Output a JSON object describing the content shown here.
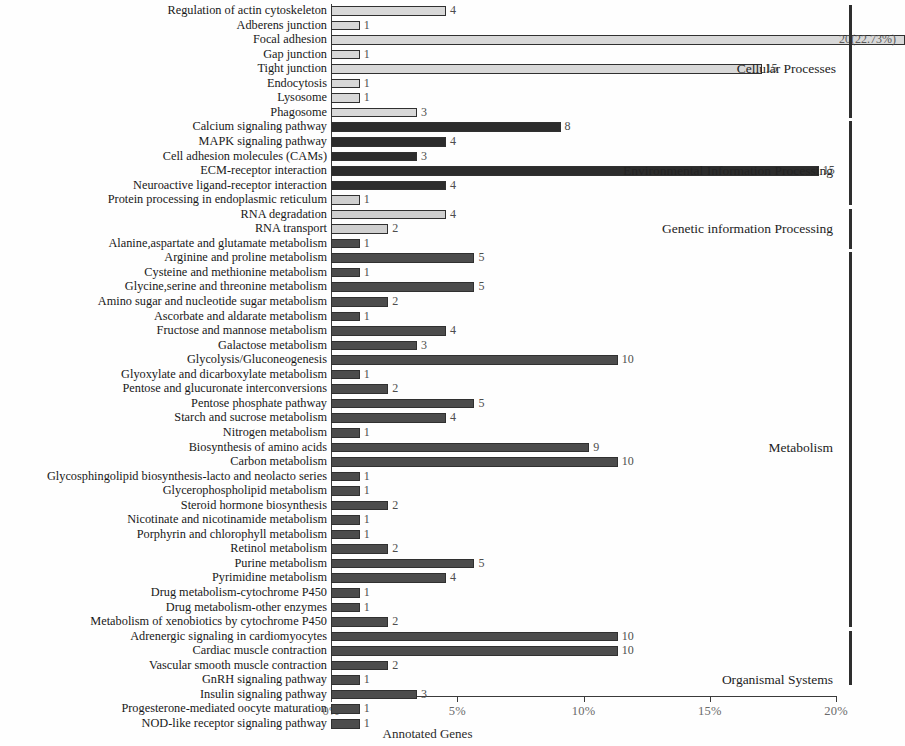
{
  "chart_data": {
    "type": "bar",
    "orientation": "horizontal",
    "title": "",
    "xlabel": "Annotated Genes",
    "ylabel": "",
    "xlim": [
      0,
      20
    ],
    "xunit": "%",
    "grid": false,
    "total_genes": 88,
    "tick_labels": [
      "0%",
      "5%",
      "10%",
      "15%",
      "20%"
    ],
    "tick_values": [
      0,
      5,
      10,
      15,
      20
    ],
    "legend_position": "right-inline-group-labels",
    "groups": [
      {
        "name": "Cellular Processes",
        "color": "#d8d8d8",
        "start_index": 0,
        "end_index": 7
      },
      {
        "name": "Environmental Information Processing",
        "color": "#2c2c2c",
        "start_index": 8,
        "end_index": 13
      },
      {
        "name": "Genetic information Processing",
        "color": "#cfcfcf",
        "start_index": 14,
        "end_index": 16
      },
      {
        "name": "Metabolism",
        "color": "#4c4c4c",
        "start_index": 17,
        "end_index": 42
      },
      {
        "name": "Organismal Systems",
        "color": "#4c4c4c",
        "start_index": 43,
        "end_index": 46
      }
    ],
    "categories": [
      "Regulation of actin cytoskeleton",
      "Adberens junction",
      "Focal adhesion",
      "Gap junction",
      "Tight junction",
      "Endocytosis",
      "Lysosome",
      "Phagosome",
      "Calcium signaling pathway",
      "MAPK signaling pathway",
      "Cell adhesion molecules (CAMs)",
      "ECM-receptor interaction",
      "Neuroactive ligand-receptor interaction",
      "Protein processing in endoplasmic reticulum",
      "RNA degradation",
      "RNA transport",
      "Alanine,aspartate and glutamate metabolism",
      "Arginine and proline metabolism",
      "Cysteine and methionine metabolism",
      "Glycine,serine and threonine metabolism",
      "Amino sugar and nucleotide sugar metabolism",
      "Ascorbate and aldarate metabolism",
      "Fructose and mannose metabolism",
      "Galactose metabolism",
      "Glycolysis/Gluconeogenesis",
      "Glyoxylate and dicarboxylate metabolism",
      "Pentose and glucuronate interconversions",
      "Pentose phosphate pathway",
      "Starch and sucrose metabolism",
      "Nitrogen metabolism",
      "Biosynthesis of amino acids",
      "Carbon metabolism",
      "Glycosphingolipid biosynthesis-lacto and neolacto series",
      "Glycerophospholipid metabolism",
      "Steroid hormone biosynthesis",
      "Nicotinate and nicotinamide metabolism",
      "Porphyrin and chlorophyll metabolism",
      "Retinol metabolism",
      "Purine metabolism",
      "Pyrimidine metabolism",
      "Drug metabolism-cytochrome P450",
      "Drug metabolism-other enzymes",
      "Metabolism of xenobiotics by cytochrome P450",
      "Adrenergic signaling in cardiomyocytes",
      "Cardiac muscle contraction",
      "Vascular smooth muscle contraction",
      "GnRH signaling pathway",
      "Insulin signaling pathway",
      "Progesterone-mediated oocyte maturation",
      "NOD-like receptor signaling pathway"
    ],
    "counts": [
      4,
      1,
      20,
      1,
      15,
      1,
      1,
      3,
      8,
      4,
      3,
      17,
      4,
      1,
      4,
      2,
      1,
      5,
      1,
      5,
      2,
      1,
      4,
      3,
      10,
      1,
      2,
      5,
      4,
      1,
      9,
      10,
      1,
      1,
      2,
      1,
      1,
      2,
      5,
      4,
      1,
      1,
      2,
      10,
      10,
      2,
      1,
      3,
      1,
      1
    ],
    "percents": [
      4.55,
      1.14,
      22.73,
      1.14,
      17.05,
      1.14,
      1.14,
      3.41,
      9.09,
      4.55,
      3.41,
      19.32,
      4.55,
      1.14,
      4.55,
      2.27,
      1.14,
      5.68,
      1.14,
      5.68,
      2.27,
      1.14,
      4.55,
      3.41,
      11.36,
      1.14,
      2.27,
      5.68,
      4.55,
      1.14,
      10.23,
      11.36,
      1.14,
      1.14,
      2.27,
      1.14,
      1.14,
      2.27,
      5.68,
      4.55,
      1.14,
      1.14,
      2.27,
      11.36,
      11.36,
      2.27,
      1.14,
      3.41,
      1.14,
      1.14
    ],
    "value_labels": [
      "4",
      "1",
      "20(22.73%)",
      "1",
      "15",
      "1",
      "1",
      "3",
      "8",
      "4",
      "3",
      "15",
      "4",
      "1",
      "4",
      "2",
      "1",
      "5",
      "1",
      "5",
      "2",
      "1",
      "4",
      "3",
      "10",
      "1",
      "2",
      "5",
      "4",
      "1",
      "9",
      "10",
      "1",
      "1",
      "2",
      "1",
      "1",
      "2",
      "5",
      "4",
      "1",
      "1",
      "2",
      "10",
      "10",
      "2",
      "1",
      "3",
      "1",
      "1"
    ],
    "rows": [
      {
        "label": "Regulation of actin cytoskeleton",
        "count": 4,
        "percent": 4.55,
        "value_label": "4",
        "group": "Cellular Processes"
      },
      {
        "label": "Adberens junction",
        "count": 1,
        "percent": 1.14,
        "value_label": "1",
        "group": "Cellular Processes"
      },
      {
        "label": "Focal adhesion",
        "count": 20,
        "percent": 22.73,
        "value_label": "20(22.73%)",
        "group": "Cellular Processes"
      },
      {
        "label": "Gap junction",
        "count": 1,
        "percent": 1.14,
        "value_label": "1",
        "group": "Cellular Processes"
      },
      {
        "label": "Tight junction",
        "count": 15,
        "percent": 17.05,
        "value_label": "15",
        "group": "Cellular Processes"
      },
      {
        "label": "Endocytosis",
        "count": 1,
        "percent": 1.14,
        "value_label": "1",
        "group": "Cellular Processes"
      },
      {
        "label": "Lysosome",
        "count": 1,
        "percent": 1.14,
        "value_label": "1",
        "group": "Cellular Processes"
      },
      {
        "label": "Phagosome",
        "count": 3,
        "percent": 3.41,
        "value_label": "3",
        "group": "Cellular Processes"
      },
      {
        "label": "Calcium signaling pathway",
        "count": 8,
        "percent": 9.09,
        "value_label": "8",
        "group": "Environmental Information Processing"
      },
      {
        "label": "MAPK signaling pathway",
        "count": 4,
        "percent": 4.55,
        "value_label": "4",
        "group": "Environmental Information Processing"
      },
      {
        "label": "Cell adhesion molecules (CAMs)",
        "count": 3,
        "percent": 3.41,
        "value_label": "3",
        "group": "Environmental Information Processing"
      },
      {
        "label": "ECM-receptor interaction",
        "count": 15,
        "percent": 19.32,
        "value_label": "15",
        "group": "Environmental Information Processing"
      },
      {
        "label": "Neuroactive ligand-receptor interaction",
        "count": 4,
        "percent": 4.55,
        "value_label": "4",
        "group": "Environmental Information Processing"
      },
      {
        "label": "Protein processing in endoplasmic reticulum",
        "count": 1,
        "percent": 1.14,
        "value_label": "1",
        "group": "Genetic information Processing"
      },
      {
        "label": "RNA degradation",
        "count": 4,
        "percent": 4.55,
        "value_label": "4",
        "group": "Genetic information Processing"
      },
      {
        "label": "RNA transport",
        "count": 2,
        "percent": 2.27,
        "value_label": "2",
        "group": "Genetic information Processing"
      },
      {
        "label": "Alanine,aspartate and glutamate metabolism",
        "count": 1,
        "percent": 1.14,
        "value_label": "1",
        "group": "Metabolism"
      },
      {
        "label": "Arginine and proline metabolism",
        "count": 5,
        "percent": 5.68,
        "value_label": "5",
        "group": "Metabolism"
      },
      {
        "label": "Cysteine and methionine metabolism",
        "count": 1,
        "percent": 1.14,
        "value_label": "1",
        "group": "Metabolism"
      },
      {
        "label": "Glycine,serine and threonine metabolism",
        "count": 5,
        "percent": 5.68,
        "value_label": "5",
        "group": "Metabolism"
      },
      {
        "label": "Amino sugar and nucleotide sugar metabolism",
        "count": 2,
        "percent": 2.27,
        "value_label": "2",
        "group": "Metabolism"
      },
      {
        "label": "Ascorbate and aldarate metabolism",
        "count": 1,
        "percent": 1.14,
        "value_label": "1",
        "group": "Metabolism"
      },
      {
        "label": "Fructose and mannose metabolism",
        "count": 4,
        "percent": 4.55,
        "value_label": "4",
        "group": "Metabolism"
      },
      {
        "label": "Galactose metabolism",
        "count": 3,
        "percent": 3.41,
        "value_label": "3",
        "group": "Metabolism"
      },
      {
        "label": "Glycolysis/Gluconeogenesis",
        "count": 10,
        "percent": 11.36,
        "value_label": "10",
        "group": "Metabolism"
      },
      {
        "label": "Glyoxylate and dicarboxylate metabolism",
        "count": 1,
        "percent": 1.14,
        "value_label": "1",
        "group": "Metabolism"
      },
      {
        "label": "Pentose and glucuronate interconversions",
        "count": 2,
        "percent": 2.27,
        "value_label": "2",
        "group": "Metabolism"
      },
      {
        "label": "Pentose phosphate pathway",
        "count": 5,
        "percent": 5.68,
        "value_label": "5",
        "group": "Metabolism"
      },
      {
        "label": "Starch and sucrose metabolism",
        "count": 4,
        "percent": 4.55,
        "value_label": "4",
        "group": "Metabolism"
      },
      {
        "label": "Nitrogen metabolism",
        "count": 1,
        "percent": 1.14,
        "value_label": "1",
        "group": "Metabolism"
      },
      {
        "label": "Biosynthesis of amino acids",
        "count": 9,
        "percent": 10.23,
        "value_label": "9",
        "group": "Metabolism"
      },
      {
        "label": "Carbon metabolism",
        "count": 10,
        "percent": 11.36,
        "value_label": "10",
        "group": "Metabolism"
      },
      {
        "label": "Glycosphingolipid biosynthesis-lacto and neolacto series",
        "count": 1,
        "percent": 1.14,
        "value_label": "1",
        "group": "Metabolism"
      },
      {
        "label": "Glycerophospholipid metabolism",
        "count": 1,
        "percent": 1.14,
        "value_label": "1",
        "group": "Metabolism"
      },
      {
        "label": "Steroid hormone biosynthesis",
        "count": 2,
        "percent": 2.27,
        "value_label": "2",
        "group": "Metabolism"
      },
      {
        "label": "Nicotinate and nicotinamide metabolism",
        "count": 1,
        "percent": 1.14,
        "value_label": "1",
        "group": "Metabolism"
      },
      {
        "label": "Porphyrin and chlorophyll metabolism",
        "count": 1,
        "percent": 1.14,
        "value_label": "1",
        "group": "Metabolism"
      },
      {
        "label": "Retinol metabolism",
        "count": 2,
        "percent": 2.27,
        "value_label": "2",
        "group": "Metabolism"
      },
      {
        "label": "Purine metabolism",
        "count": 5,
        "percent": 5.68,
        "value_label": "5",
        "group": "Metabolism"
      },
      {
        "label": "Pyrimidine metabolism",
        "count": 4,
        "percent": 4.55,
        "value_label": "4",
        "group": "Metabolism"
      },
      {
        "label": "Drug metabolism-cytochrome P450",
        "count": 1,
        "percent": 1.14,
        "value_label": "1",
        "group": "Metabolism"
      },
      {
        "label": "Drug metabolism-other enzymes",
        "count": 1,
        "percent": 1.14,
        "value_label": "1",
        "group": "Metabolism"
      },
      {
        "label": "Metabolism of xenobiotics by cytochrome P450",
        "count": 2,
        "percent": 2.27,
        "value_label": "2",
        "group": "Metabolism"
      },
      {
        "label": "Adrenergic signaling in cardiomyocytes",
        "count": 10,
        "percent": 11.36,
        "value_label": "10",
        "group": "Organismal Systems"
      },
      {
        "label": "Cardiac muscle contraction",
        "count": 10,
        "percent": 11.36,
        "value_label": "10",
        "group": "Organismal Systems"
      },
      {
        "label": "Vascular smooth muscle contraction",
        "count": 2,
        "percent": 2.27,
        "value_label": "2",
        "group": "Organismal Systems"
      },
      {
        "label": "GnRH signaling pathway",
        "count": 1,
        "percent": 1.14,
        "value_label": "1",
        "group": "Organismal Systems"
      },
      {
        "label": "Insulin signaling pathway",
        "count": 3,
        "percent": 3.41,
        "value_label": "3",
        "group": "Organismal Systems"
      },
      {
        "label": "Progesterone-mediated oocyte maturation",
        "count": 1,
        "percent": 1.14,
        "value_label": "1",
        "group": "Organismal Systems"
      },
      {
        "label": "NOD-like receptor signaling pathway",
        "count": 1,
        "percent": 1.14,
        "value_label": "1",
        "group": "Organismal Systems"
      }
    ],
    "group_annotations": [
      {
        "text": "Cellular Processes",
        "row_index": 4
      },
      {
        "text": "Environmental Information Processing",
        "row_index": 11
      },
      {
        "text": "Genetic information Processing",
        "row_index": 15
      },
      {
        "text": "Metabolism",
        "row_index": 30
      },
      {
        "text": "Organismal Systems",
        "row_index": 46
      }
    ]
  }
}
